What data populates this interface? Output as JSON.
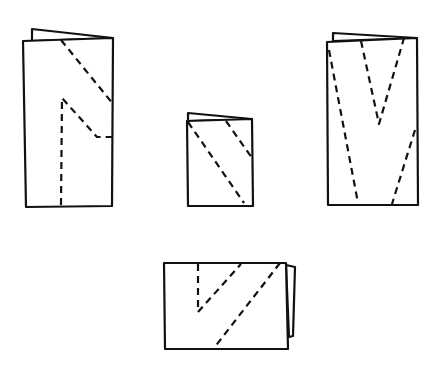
{
  "figure": {
    "stroke_color": "#111111",
    "background": "#ffffff",
    "shapes": [
      {
        "id": "tall-left",
        "back_flap": "32,41 32,29 113,38",
        "front": "23,41 113,38 112,206 26,207",
        "cuts": [
          "61,40 113,104",
          "61,205 62,98 97,137 112,137"
        ]
      },
      {
        "id": "small-center",
        "back_flap": "188,121 188,113 252,119",
        "front": "187,121 252,119 253,206 188,206",
        "cuts": [
          "188,122 244,203",
          "226,121 252,158"
        ]
      },
      {
        "id": "tall-right",
        "back_flap": "333,41 333,33 417,38",
        "front": "327,42 417,38 418,205 328,205",
        "cuts": [
          "329,50 358,203",
          "361,41 379,124 404,38",
          "415,130 392,204"
        ]
      },
      {
        "id": "wide-bottom",
        "back_flap": "286,265 295,267 293,336 289,337",
        "front": "164,263 286,263 288,349 165,349",
        "cuts": [
          "198,264 198,312 241,264",
          "280,263 214,348"
        ]
      }
    ]
  }
}
